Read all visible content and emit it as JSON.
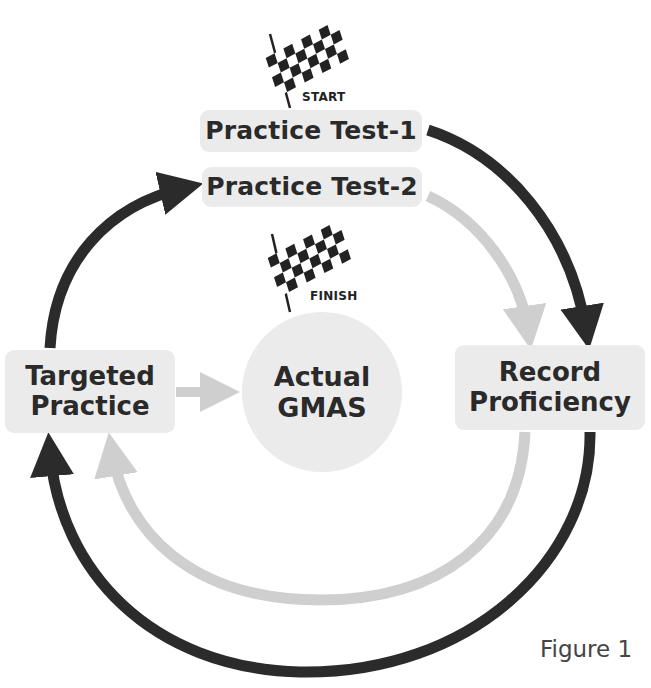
{
  "diagram": {
    "nodes": {
      "practice_test_1": "Practice Test-1",
      "practice_test_2": "Practice Test-2",
      "targeted_practice": [
        "Targeted",
        "Practice"
      ],
      "actual_gmas": [
        "Actual",
        "GMAS"
      ],
      "record_proficiency": [
        "Record",
        "Proficiency"
      ]
    },
    "flags": {
      "start": "START",
      "finish": "FINISH"
    },
    "caption": "Figure 1",
    "colors": {
      "box_fill": "#ebebeb",
      "dark_arrow": "#2b2b2b",
      "light_arrow": "#cfcfcf",
      "text": "#2a2a2a"
    },
    "edges": [
      {
        "from": "Practice Test-1",
        "to": "Record Proficiency",
        "style": "dark"
      },
      {
        "from": "Practice Test-2",
        "to": "Record Proficiency",
        "style": "light"
      },
      {
        "from": "Record Proficiency",
        "to": "Targeted Practice",
        "style": "dark",
        "route": "outer-bottom"
      },
      {
        "from": "Record Proficiency",
        "to": "Targeted Practice",
        "style": "light",
        "route": "inner-bottom"
      },
      {
        "from": "Targeted Practice",
        "to": "Practice Test-2",
        "style": "dark"
      },
      {
        "from": "Targeted Practice",
        "to": "Actual GMAS",
        "style": "light"
      }
    ]
  }
}
